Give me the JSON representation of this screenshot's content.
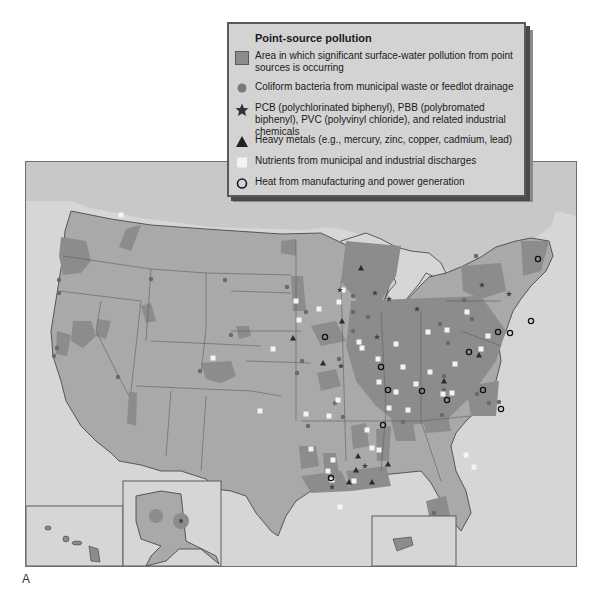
{
  "legend": {
    "title": "Point-source pollution",
    "items": [
      {
        "icon": "gray-square-icon",
        "label": "Area in which significant surface-water pollution from point sources is occurring"
      },
      {
        "icon": "dot-icon",
        "label": "Coliform bacteria from municipal waste or feedlot drainage"
      },
      {
        "icon": "star-icon",
        "label": "PCB (polychlorinated biphenyl), PBB (polybromated biphenyl), PVC (polyvinyl chloride), and related industrial chemicals"
      },
      {
        "icon": "triangle-icon",
        "label": "Heavy metals (e.g., mercury, zinc, copper, cadmium, lead)"
      },
      {
        "icon": "white-square-icon",
        "label": "Nutrients from municipal and industrial discharges"
      },
      {
        "icon": "ring-icon",
        "label": "Heat from manufacturing and power generation"
      }
    ]
  },
  "figure_label": "A",
  "colors": {
    "water": "#d6d6d6",
    "land": "#a9a9a9",
    "polluted": "#8c8c8c",
    "border": "#5e5e5e",
    "marker_dark": "#2b2b2b",
    "marker_dot": "#6a6a6a",
    "nutrient": "#f4f4f4"
  },
  "map": {
    "insets": [
      "Hawaii",
      "Alaska",
      "Puerto Rico"
    ],
    "markers": {
      "nutrients": [
        [
          95,
          101
        ],
        [
          212,
          357
        ],
        [
          120,
          214
        ],
        [
          273,
          139
        ],
        [
          298,
          319
        ],
        [
          272,
          348
        ],
        [
          358,
          341
        ],
        [
          377,
          358
        ],
        [
          361,
          347
        ],
        [
          395,
          343
        ],
        [
          402,
          366
        ],
        [
          427,
          331
        ],
        [
          446,
          329
        ],
        [
          466,
          311
        ],
        [
          454,
          363
        ],
        [
          487,
          335
        ],
        [
          480,
          348
        ],
        [
          429,
          371
        ],
        [
          415,
          383
        ],
        [
          395,
          391
        ],
        [
          378,
          381
        ],
        [
          388,
          407
        ],
        [
          407,
          409
        ],
        [
          305,
          413
        ],
        [
          328,
          415
        ],
        [
          337,
          399
        ],
        [
          366,
          429
        ],
        [
          371,
          447
        ],
        [
          310,
          448
        ],
        [
          353,
          480
        ],
        [
          332,
          459
        ],
        [
          327,
          470
        ],
        [
          339,
          506
        ],
        [
          378,
          449
        ],
        [
          465,
          454
        ],
        [
          473,
          466
        ],
        [
          442,
          393
        ],
        [
          451,
          392
        ],
        [
          338,
          301
        ],
        [
          342,
          289
        ],
        [
          318,
          308
        ],
        [
          295,
          300
        ],
        [
          259,
          410
        ],
        [
          331,
          479
        ]
      ],
      "heat": [
        [
          537,
          258
        ],
        [
          324,
          336
        ],
        [
          380,
          366
        ],
        [
          387,
          389
        ],
        [
          421,
          390
        ],
        [
          468,
          351
        ],
        [
          509,
          332
        ],
        [
          497,
          331
        ],
        [
          530,
          320
        ],
        [
          500,
          408
        ],
        [
          446,
          399
        ],
        [
          382,
          424
        ],
        [
          482,
          389
        ],
        [
          330,
          477
        ]
      ],
      "heavy_metals": [
        [
          360,
          267
        ],
        [
          292,
          337
        ],
        [
          322,
          362
        ],
        [
          478,
          354
        ],
        [
          443,
          380
        ],
        [
          341,
          320
        ],
        [
          355,
          469
        ],
        [
          387,
          463
        ],
        [
          357,
          455
        ],
        [
          348,
          481
        ],
        [
          371,
          481
        ]
      ],
      "pcb": [
        [
          339,
          289
        ],
        [
          374,
          292
        ],
        [
          388,
          298
        ],
        [
          416,
          308
        ],
        [
          481,
          284
        ],
        [
          508,
          293
        ],
        [
          340,
          365
        ],
        [
          376,
          336
        ],
        [
          364,
          465
        ],
        [
          331,
          486
        ]
      ],
      "coliform": [
        [
          150,
          278
        ],
        [
          224,
          279
        ],
        [
          58,
          279
        ],
        [
          58,
          292
        ],
        [
          56,
          347
        ],
        [
          53,
          355
        ],
        [
          117,
          376
        ],
        [
          199,
          370
        ],
        [
          230,
          334
        ],
        [
          286,
          286
        ],
        [
          305,
          311
        ],
        [
          352,
          330
        ],
        [
          367,
          316
        ],
        [
          352,
          295
        ],
        [
          352,
          311
        ],
        [
          301,
          360
        ],
        [
          296,
          372
        ],
        [
          338,
          358
        ],
        [
          334,
          402
        ],
        [
          443,
          375
        ],
        [
          443,
          389
        ],
        [
          441,
          414
        ],
        [
          463,
          299
        ],
        [
          447,
          342
        ],
        [
          475,
          255
        ],
        [
          471,
          318
        ],
        [
          476,
          393
        ],
        [
          342,
          416
        ],
        [
          307,
          425
        ],
        [
          488,
          402
        ],
        [
          498,
          401
        ],
        [
          433,
          512
        ],
        [
          402,
          421
        ],
        [
          439,
          323
        ]
      ]
    }
  }
}
